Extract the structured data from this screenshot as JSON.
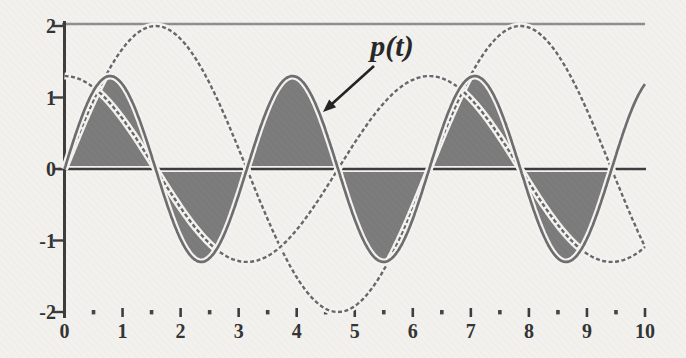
{
  "chart_data": {
    "type": "line",
    "title": "",
    "xlabel": "",
    "ylabel": "",
    "xlim": [
      0,
      10
    ],
    "ylim": [
      -2,
      2
    ],
    "grid": false,
    "frame": "top-line and left axis only, horizontal t-axis through y=0",
    "x_major_ticks": [
      0,
      1,
      2,
      3,
      4,
      5,
      6,
      7,
      8,
      9,
      10
    ],
    "x_tick_labels": [
      "0",
      "1",
      "2",
      "3",
      "4",
      "5",
      "6",
      "7",
      "8",
      "9",
      "10"
    ],
    "x_minor_tick_step": 0.5,
    "y_major_ticks": [
      -2,
      -1,
      0,
      1,
      2
    ],
    "y_tick_labels": [
      "-2",
      "-1",
      "0",
      "1",
      "2"
    ],
    "series": [
      {
        "name": "v",
        "formula": "2 sin(t)",
        "fn": "sin",
        "amplitude": 2,
        "omega": 1,
        "phase": 0,
        "t_start": 0,
        "t_end": 10.0,
        "style": "plain",
        "key_points": "zeros at 0, 3.14, 6.28, 9.42; max 2 at 1.57 and 7.85; min -2 at 4.71"
      },
      {
        "name": "i",
        "formula": "1.3 cos(t)",
        "fn": "cos",
        "amplitude": 1.3,
        "omega": 1,
        "phase": 0,
        "t_start": 0,
        "t_end": 10.0,
        "style": "plain",
        "key_points": "starts at 1.3; zeros at 1.57, 4.71, 7.85; min -1.3 at 3.14 and 9.42; max 1.3 at 6.28"
      },
      {
        "name": "p",
        "formula": "1.3 sin(2t)",
        "fn": "sin",
        "amplitude": 1.3,
        "omega": 2,
        "phase": 0,
        "t_start": 0,
        "t_end": 10.0,
        "style": "shaded",
        "shade_from": 0,
        "shade_to": 9.42477796,
        "key_points": "shaded humps between curve and t-axis; peaks 1.3 at 0.79, 3.93, 7.07; troughs -1.3 at 2.36, 5.50, 8.64; zeros every 1.57"
      }
    ],
    "annotation": {
      "text": "p(t)",
      "label_px": [
        392,
        56
      ],
      "arrow_from_px": [
        374,
        66
      ],
      "arrow_to_px": [
        323,
        112
      ]
    },
    "axes_px": {
      "origin": [
        64.5,
        169
      ],
      "px_per_unit_x": 58.05,
      "px_per_unit_y": 71.5,
      "top_line_y": 24,
      "axis_right_x": 645,
      "tick_row_y": 308
    },
    "colors": {
      "background": "#f2f1ee",
      "curve": "#676767",
      "p_outline": "#6d6d6d",
      "fill": "#7b7b7b",
      "axis": "#3c3c3c",
      "tick": "#444444",
      "tick_label": "#333333",
      "top_line": "#8e8e8e",
      "annotation": "#222222",
      "casing": "#f4f3f1"
    }
  }
}
